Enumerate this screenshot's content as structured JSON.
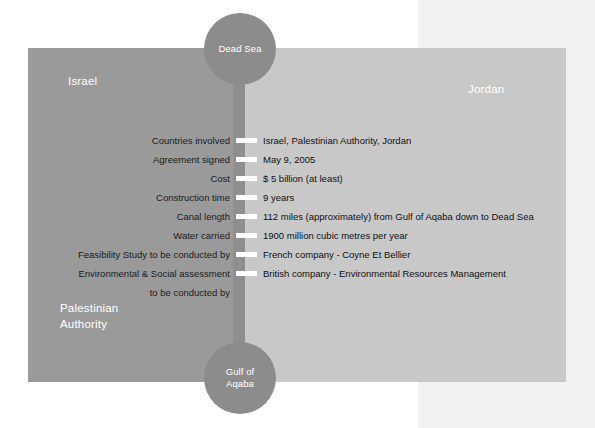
{
  "map": {
    "regions": [
      {
        "name": "Israel",
        "label": "Israel",
        "color": "#9a9a9a"
      },
      {
        "name": "Jordan",
        "label": "Jordan",
        "color": "#c8c8c8"
      },
      {
        "name": "Palestinian Authority",
        "label_line1": "Palestinian",
        "label_line2": "Authority",
        "color": "#9a9a9a"
      }
    ],
    "water_bodies": [
      {
        "name": "Dead Sea",
        "label_line1": "Dead Sea",
        "label_line2": "",
        "color": "#8c8c8c"
      },
      {
        "name": "Gulf of Aqaba",
        "label_line1": "Gulf of",
        "label_line2": "Aqaba",
        "color": "#8c8c8c"
      }
    ],
    "canal": {
      "name": "canal",
      "color": "#8e8e8e"
    }
  },
  "facts": [
    {
      "label": "Countries involved",
      "value": "Israel, Palestinian Authority, Jordan"
    },
    {
      "label": "Agreement signed",
      "value": "May 9, 2005"
    },
    {
      "label": "Cost",
      "value": "$ 5 billion (at least)"
    },
    {
      "label": "Construction time",
      "value": "9 years"
    },
    {
      "label": "Canal length",
      "value": "112 miles (approximately) from Gulf of Aqaba down to Dead Sea"
    },
    {
      "label": "Water carried",
      "value": "1900 million cubic metres per year"
    },
    {
      "label": "Feasibility Study to be conducted by",
      "value": "French company - Coyne Et Bellier"
    },
    {
      "label": "Environmental & Social assessment",
      "value": "British company - Environmental Resources Management"
    },
    {
      "label": "to be conducted by",
      "value": ""
    }
  ]
}
